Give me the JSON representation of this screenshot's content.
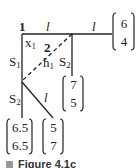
{
  "diagram": {
    "nodes": [
      {
        "id": "1",
        "label": "1"
      },
      {
        "id": "2",
        "label": "2"
      }
    ],
    "edge_labels": {
      "top_left": "l",
      "top_right": "l",
      "diagonal": "l"
    },
    "symbols": {
      "x1_main": "x",
      "x1_sub": "1",
      "h1_main": "h",
      "h1_sub": "1",
      "s1_main": "S",
      "s1_sub": "1",
      "s2_upper_main": "S",
      "s2_upper_sub": "2",
      "s2_lower_main": "S",
      "s2_lower_sub": "2"
    },
    "vectors": [
      {
        "name": "top-right",
        "top": "6",
        "bottom": "4"
      },
      {
        "name": "middle",
        "top": "7",
        "bottom": "5"
      },
      {
        "name": "bottom-left",
        "top": "6.5",
        "bottom": "6.5"
      },
      {
        "name": "bottom-center",
        "top": "5",
        "bottom": "7"
      }
    ]
  },
  "caption": {
    "text": "Figure 4.1c"
  }
}
